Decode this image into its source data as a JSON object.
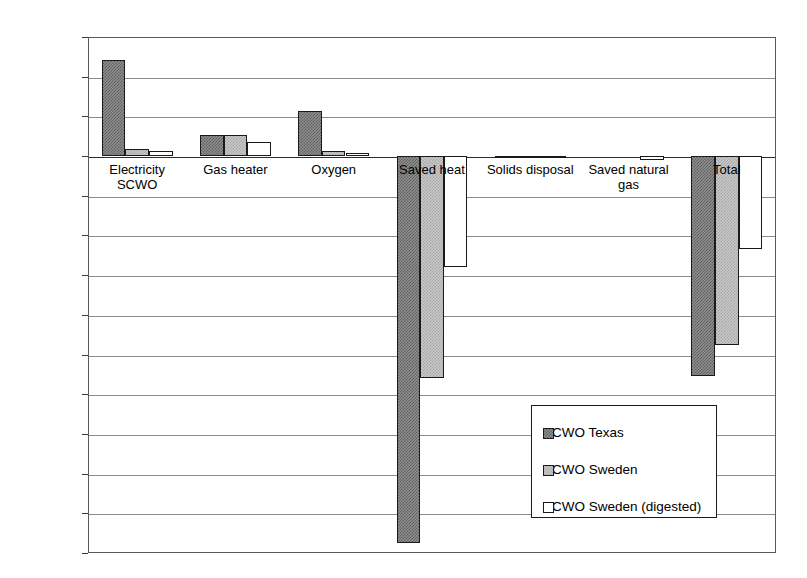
{
  "chart_data": {
    "type": "bar",
    "title": "",
    "xlabel": "",
    "ylabel": "",
    "ylim": [
      -100000,
      30000
    ],
    "ytick_step": 10000,
    "grid": true,
    "legend_position": "inside-lower-right",
    "yticks": [
      "30000",
      "20000",
      "10000",
      "0",
      "-10000",
      "-20000",
      "-30000",
      "-40000",
      "-50000",
      "-60000",
      "-70000",
      "-80000",
      "-90000",
      "-100000"
    ],
    "ytick_values": [
      30000,
      20000,
      10000,
      0,
      -10000,
      -20000,
      -30000,
      -40000,
      -50000,
      -60000,
      -70000,
      -80000,
      -90000,
      -100000
    ],
    "categories": [
      "Electricity SCWO",
      "Gas heater",
      "Oxygen",
      "Saved heat",
      "Solids disposal",
      "Saved natural gas",
      "Total"
    ],
    "series": [
      {
        "name": "SCWO Texas",
        "values": [
          24200,
          5300,
          11400,
          -97500,
          -200,
          0,
          -55500
        ]
      },
      {
        "name": "SCWO Sweden",
        "values": [
          1700,
          5300,
          1200,
          -56000,
          -150,
          0,
          -47500
        ]
      },
      {
        "name": "SCWO Sweden (digested)",
        "values": [
          1200,
          3600,
          900,
          -28000,
          -100,
          -1100,
          -23500
        ]
      }
    ]
  },
  "legend": {
    "items": [
      {
        "label": "SCWO Texas",
        "swatch": "dark-hatch"
      },
      {
        "label": "SCWO Sweden",
        "swatch": "light-hatch"
      },
      {
        "label": "SCWO Sweden (digested)",
        "swatch": "white"
      }
    ]
  },
  "colors": {
    "series_texas": "#8f8f8f",
    "series_sweden": "#c9c9c9",
    "series_sweden_digested": "#ffffff",
    "axis": "#5a5a5a",
    "grid": "#8a8a8a",
    "text": "#000000"
  }
}
